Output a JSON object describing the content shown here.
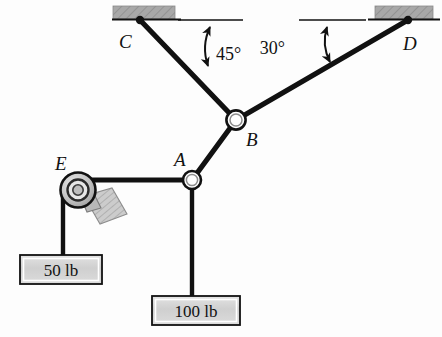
{
  "figure": {
    "type": "statics-free-body-diagram",
    "background_color": "#fdfdfd",
    "line_color": "#111111",
    "support_fill": "#a8a8a8",
    "box_fill": "#d2d2d2",
    "pulley_fill": "#c9c9c9"
  },
  "points": [
    {
      "id": "C",
      "label": "C",
      "x": 140,
      "y": 20,
      "label_x": 119,
      "label_y": 48,
      "kind": "cable-anchor"
    },
    {
      "id": "D",
      "label": "D",
      "x": 408,
      "y": 20,
      "label_x": 403,
      "label_y": 50,
      "kind": "cable-anchor"
    },
    {
      "id": "B",
      "label": "B",
      "x": 236,
      "y": 120,
      "label_x": 246,
      "label_y": 144,
      "kind": "ring-joint"
    },
    {
      "id": "A",
      "label": "A",
      "x": 192,
      "y": 180,
      "label_x": 174,
      "label_y": 166,
      "kind": "ring-joint"
    },
    {
      "id": "E",
      "label": "E",
      "x": 78,
      "y": 190,
      "label_x": 55,
      "label_y": 170,
      "kind": "pulley"
    }
  ],
  "members": [
    {
      "id": "CB",
      "from": "C",
      "to": "B",
      "kind": "cable"
    },
    {
      "id": "BD",
      "from": "B",
      "to": "D",
      "kind": "cable"
    },
    {
      "id": "AB",
      "from": "A",
      "to": "B",
      "kind": "cable"
    },
    {
      "id": "AE",
      "from": "A",
      "to": "E",
      "kind": "cable"
    },
    {
      "id": "A-load",
      "from": "A",
      "to": "100 lb box",
      "kind": "cable"
    },
    {
      "id": "E-load",
      "from": "E",
      "to": "50 lb box",
      "kind": "cable"
    }
  ],
  "angles": [
    {
      "id": "angle-45",
      "label": "45°",
      "value": 45,
      "unit": "degrees",
      "at": "C",
      "measured_from": "horizontal",
      "label_x": 219,
      "label_y": 58
    },
    {
      "id": "angle-30",
      "label": "30°",
      "value": 30,
      "unit": "degrees",
      "at": "D",
      "measured_from": "horizontal",
      "label_x": 288,
      "label_y": 52
    }
  ],
  "loads": [
    {
      "id": "load-50",
      "label": "50 lb",
      "magnitude": 50,
      "unit": "lb",
      "attached_to": "E",
      "box_x": 20,
      "box_y": 255,
      "box_w": 82,
      "box_h": 29
    },
    {
      "id": "load-100",
      "label": "100 lb",
      "magnitude": 100,
      "unit": "lb",
      "attached_to": "A",
      "box_x": 152,
      "box_y": 296,
      "box_w": 88,
      "box_h": 29
    }
  ],
  "supports": [
    {
      "id": "support-C",
      "x": 113,
      "y": 6,
      "w": 62,
      "h": 13,
      "line_x1": 113,
      "line_x2": 181
    },
    {
      "id": "support-D",
      "x": 375,
      "y": 6,
      "w": 57,
      "h": 13,
      "line_x1": 368,
      "line_x2": 438
    }
  ],
  "reference_lines": [
    {
      "id": "ref-line-left",
      "x1": 178,
      "y1": 20,
      "x2": 242,
      "y2": 20
    },
    {
      "id": "ref-line-right",
      "x1": 300,
      "y1": 20,
      "x2": 366,
      "y2": 20
    }
  ]
}
